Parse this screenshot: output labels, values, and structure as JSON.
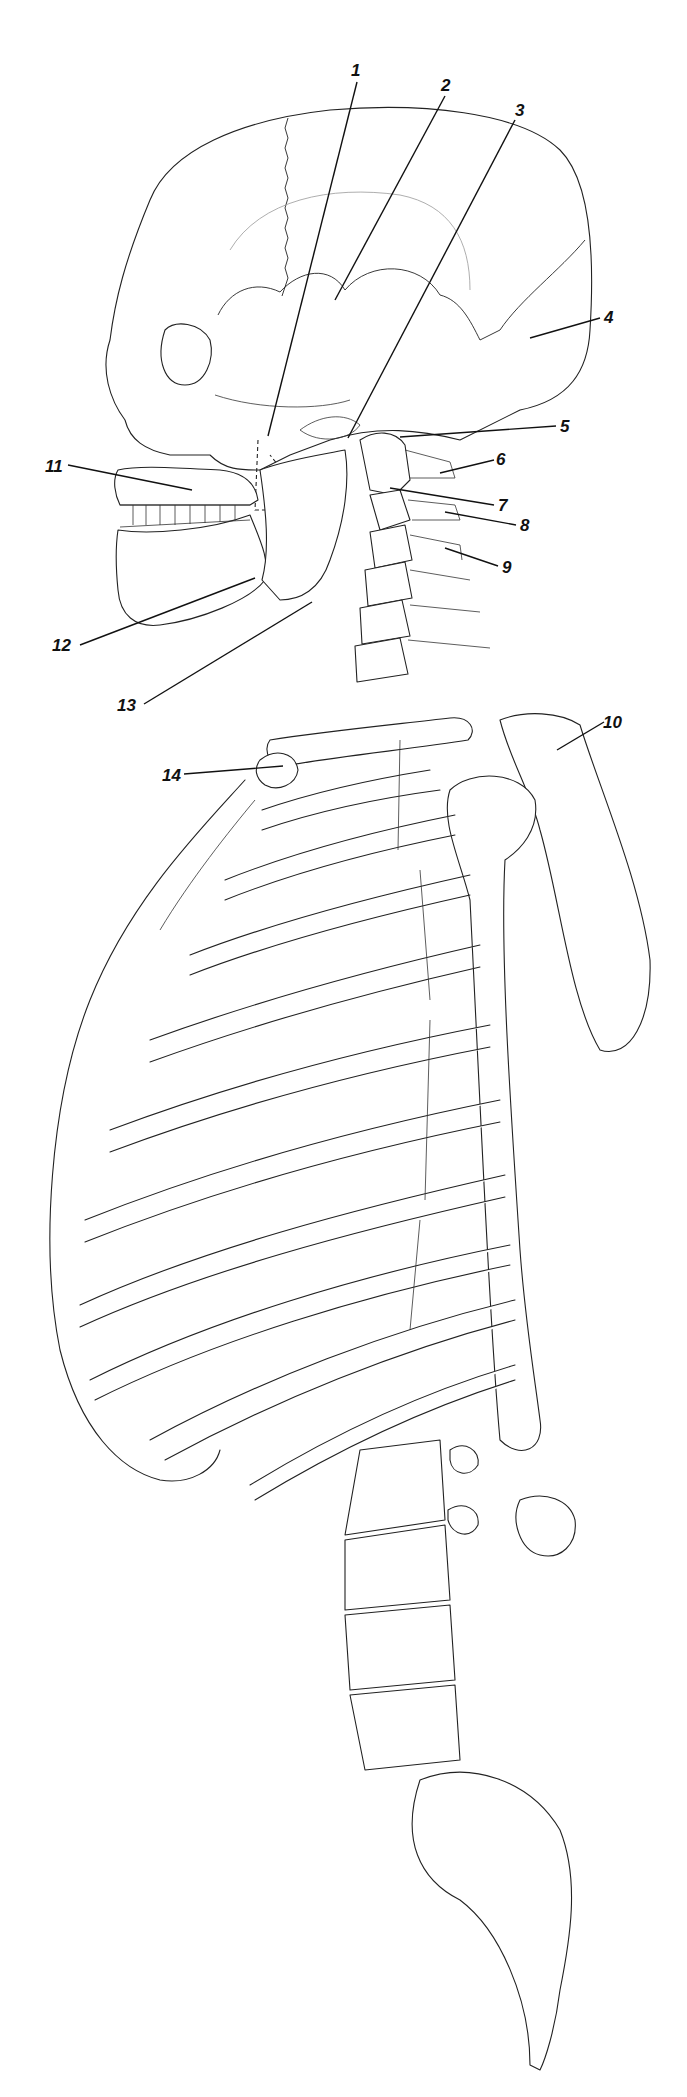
{
  "diagram": {
    "title": "",
    "labels": [
      {
        "id": "1",
        "text": "1",
        "x": 351,
        "y": 62,
        "line": [
          357,
          82,
          268,
          436
        ]
      },
      {
        "id": "2",
        "text": "2",
        "x": 441,
        "y": 77,
        "line": [
          445,
          96,
          335,
          300
        ]
      },
      {
        "id": "3",
        "text": "3",
        "x": 515,
        "y": 102,
        "line": [
          515,
          120,
          348,
          438
        ]
      },
      {
        "id": "4",
        "text": "4",
        "x": 604,
        "y": 309,
        "line": [
          600,
          318,
          530,
          338
        ]
      },
      {
        "id": "5",
        "text": "5",
        "x": 560,
        "y": 418,
        "line": [
          556,
          426,
          400,
          437
        ]
      },
      {
        "id": "6",
        "text": "6",
        "x": 496,
        "y": 451,
        "line": [
          494,
          460,
          440,
          473
        ]
      },
      {
        "id": "7",
        "text": "7",
        "x": 498,
        "y": 497,
        "line": [
          494,
          505,
          390,
          488
        ]
      },
      {
        "id": "8",
        "text": "8",
        "x": 520,
        "y": 517,
        "line": [
          516,
          525,
          445,
          512
        ]
      },
      {
        "id": "9",
        "text": "9",
        "x": 502,
        "y": 559,
        "line": [
          498,
          566,
          445,
          548
        ]
      },
      {
        "id": "10",
        "text": "10",
        "x": 603,
        "y": 714,
        "line": [
          604,
          722,
          557,
          750
        ]
      },
      {
        "id": "11",
        "text": "11",
        "x": 45,
        "y": 458,
        "line": [
          68,
          465,
          192,
          490
        ]
      },
      {
        "id": "12",
        "text": "12",
        "x": 52,
        "y": 637,
        "line": [
          80,
          645,
          255,
          578
        ]
      },
      {
        "id": "13",
        "text": "13",
        "x": 117,
        "y": 697,
        "line": [
          144,
          704,
          312,
          602
        ]
      },
      {
        "id": "14",
        "text": "14",
        "x": 162,
        "y": 767,
        "line": [
          184,
          774,
          283,
          766
        ]
      }
    ]
  }
}
